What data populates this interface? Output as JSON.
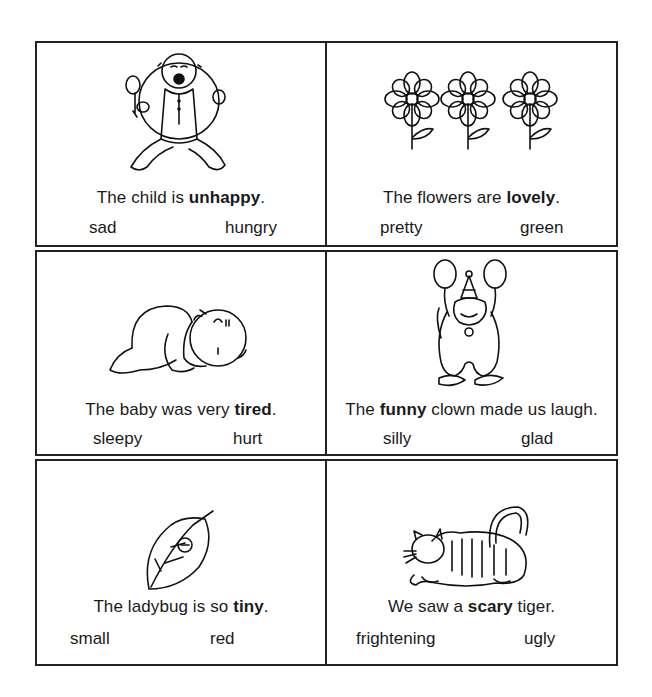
{
  "worksheet": {
    "cards": [
      {
        "picture": "crying-child",
        "sentence_before": "The child is ",
        "bold_word": "unhappy",
        "sentence_after": ".",
        "choices": [
          "sad",
          "hungry"
        ]
      },
      {
        "picture": "three-flowers",
        "sentence_before": "The flowers are ",
        "bold_word": "lovely",
        "sentence_after": ".",
        "choices": [
          "pretty",
          "green"
        ]
      },
      {
        "picture": "sleeping-baby",
        "sentence_before": "The baby was very ",
        "bold_word": "tired",
        "sentence_after": ".",
        "choices": [
          "sleepy",
          "hurt"
        ]
      },
      {
        "picture": "clown-with-balloons",
        "sentence_before": "The ",
        "bold_word": "funny",
        "sentence_after": " clown made us laugh.",
        "choices": [
          "silly",
          "glad"
        ]
      },
      {
        "picture": "ladybug-on-leaf",
        "sentence_before": "The ladybug is so ",
        "bold_word": "tiny",
        "sentence_after": ".",
        "choices": [
          "small",
          "red"
        ]
      },
      {
        "picture": "crouching-tiger",
        "sentence_before": "We saw a ",
        "bold_word": "scary",
        "sentence_after": " tiger.",
        "choices": [
          "frightening",
          "ugly"
        ]
      }
    ]
  }
}
